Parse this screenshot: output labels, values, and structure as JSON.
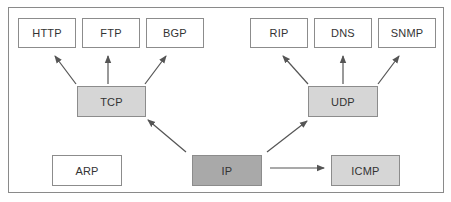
{
  "diagram": {
    "type": "protocol-dependency",
    "colors": {
      "frame_border": "#8a8a8a",
      "box_border": "#8c8c8c",
      "application_fill": "#ffffff",
      "transport_fill": "#d6d6d6",
      "network_fill": "#a9a9a9",
      "icmp_fill": "#d6d6d6",
      "arp_fill": "#ffffff",
      "arrow": "#555555"
    },
    "nodes": {
      "http": {
        "label": "HTTP",
        "layer": "application"
      },
      "ftp": {
        "label": "FTP",
        "layer": "application"
      },
      "bgp": {
        "label": "BGP",
        "layer": "application"
      },
      "rip": {
        "label": "RIP",
        "layer": "application"
      },
      "dns": {
        "label": "DNS",
        "layer": "application"
      },
      "snmp": {
        "label": "SNMP",
        "layer": "application"
      },
      "tcp": {
        "label": "TCP",
        "layer": "transport"
      },
      "udp": {
        "label": "UDP",
        "layer": "transport"
      },
      "arp": {
        "label": "ARP",
        "layer": "link"
      },
      "ip": {
        "label": "IP",
        "layer": "network"
      },
      "icmp": {
        "label": "ICMP",
        "layer": "network"
      }
    },
    "edges": [
      {
        "from": "TCP",
        "to": "HTTP"
      },
      {
        "from": "TCP",
        "to": "FTP"
      },
      {
        "from": "TCP",
        "to": "BGP"
      },
      {
        "from": "UDP",
        "to": "RIP"
      },
      {
        "from": "UDP",
        "to": "DNS"
      },
      {
        "from": "UDP",
        "to": "SNMP"
      },
      {
        "from": "IP",
        "to": "TCP"
      },
      {
        "from": "IP",
        "to": "UDP"
      },
      {
        "from": "IP",
        "to": "ICMP"
      }
    ]
  }
}
